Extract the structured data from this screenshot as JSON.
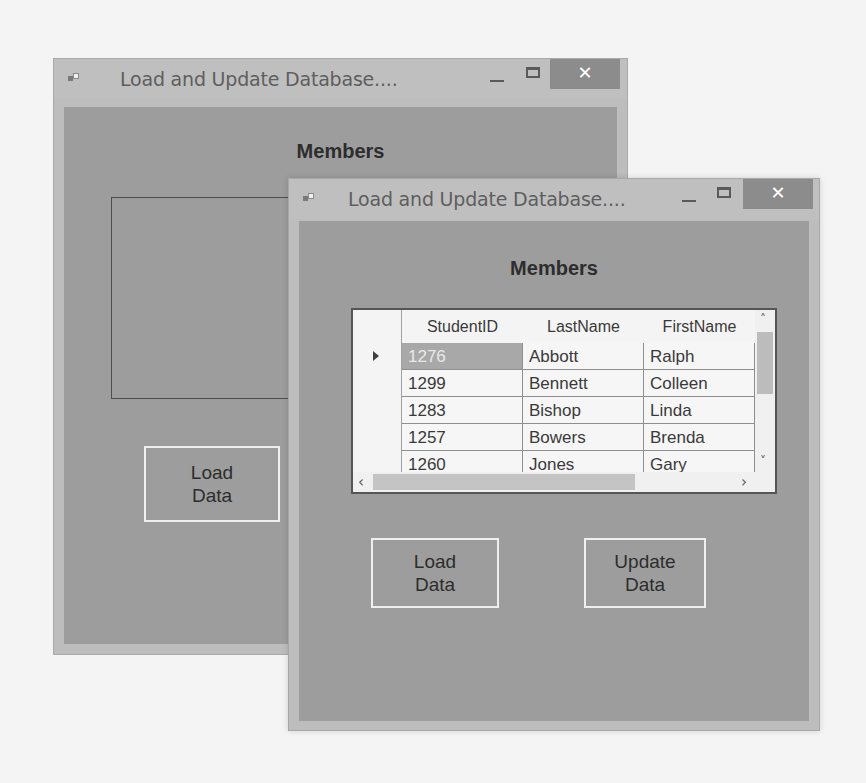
{
  "back_window": {
    "title": "Load and Update Database....",
    "controls": {
      "minimize": "—",
      "maximize": "□",
      "close": "✕"
    },
    "heading": "Members",
    "grid": "empty",
    "buttons": {
      "load_line1": "Load",
      "load_line2": "Data"
    }
  },
  "front_window": {
    "title": "Load and Update Database....",
    "controls": {
      "minimize": "—",
      "maximize": "□",
      "close": "✕"
    },
    "heading": "Members",
    "grid": {
      "columns": [
        "StudentID",
        "LastName",
        "FirstName"
      ],
      "rows": [
        {
          "StudentID": "1276",
          "LastName": "Abbott",
          "FirstName": "Ralph",
          "selected": true
        },
        {
          "StudentID": "1299",
          "LastName": "Bennett",
          "FirstName": "Colleen"
        },
        {
          "StudentID": "1283",
          "LastName": "Bishop",
          "FirstName": "Linda"
        },
        {
          "StudentID": "1257",
          "LastName": "Bowers",
          "FirstName": "Brenda"
        },
        {
          "StudentID": "1260",
          "LastName": "Jones",
          "FirstName": "Gary"
        }
      ],
      "scroll": {
        "up": "˄",
        "down": "˅",
        "left": "‹",
        "right": "›"
      }
    },
    "buttons": {
      "load_line1": "Load",
      "load_line2": "Data",
      "update_line1": "Update",
      "update_line2": "Data"
    }
  },
  "colors": {
    "client_bg": "#9d9d9d",
    "titlebar_bg": "#bfbfbf",
    "close_bg": "#8c8c8c",
    "selected_cell": "#a8a8a8"
  }
}
